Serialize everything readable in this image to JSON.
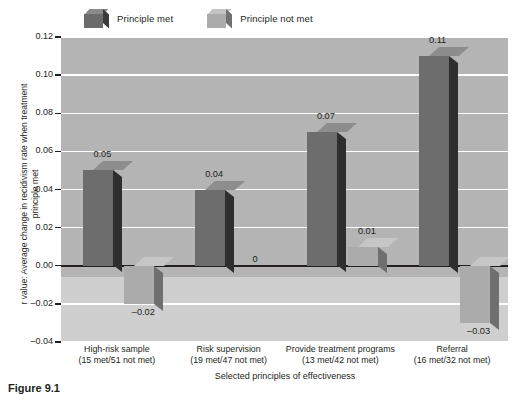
{
  "legend": {
    "items": [
      {
        "label": "Principle met",
        "icon": "cube-dark-icon",
        "color": "#6b6b6b"
      },
      {
        "label": "Principle not met",
        "icon": "cube-light-icon",
        "color": "#ababab"
      }
    ]
  },
  "axes": {
    "ylabel": "r value: Average change in recidivism rate when treatment principle met",
    "xlabel": "Selected principles of effectiveness",
    "yticks": [
      "0.12",
      "0.10",
      "0.08",
      "0.06",
      "0.04",
      "0.02",
      "0.00",
      "–0.02",
      "–0.04"
    ]
  },
  "caption": "Figure 9.1",
  "chart_data": {
    "type": "bar",
    "title": "",
    "xlabel": "Selected principles of effectiveness",
    "ylabel": "r value: Average change in recidivism rate when treatment principle met",
    "ylim": [
      -0.04,
      0.12
    ],
    "ytick_step": 0.02,
    "grid": true,
    "legend_position": "top-left",
    "categories": [
      "High-risk sample",
      "Risk supervision",
      "Provide treatment programs",
      "Referral"
    ],
    "category_sublabels": [
      "(15 met/51 not met)",
      "(19 met/47 not met)",
      "(13 met/42 not met)",
      "(16 met/32 not met)"
    ],
    "series": [
      {
        "name": "Principle met",
        "color": "#6b6b6b",
        "values": [
          0.05,
          0.04,
          0.07,
          0.11
        ],
        "labels": [
          "0.05",
          "0.04",
          "0.07",
          "0.11"
        ]
      },
      {
        "name": "Principle not met",
        "color": "#ababab",
        "values": [
          -0.02,
          0.0,
          0.01,
          -0.03
        ],
        "labels": [
          "–0.02",
          "0",
          "0.01",
          "–0.03"
        ]
      }
    ]
  }
}
